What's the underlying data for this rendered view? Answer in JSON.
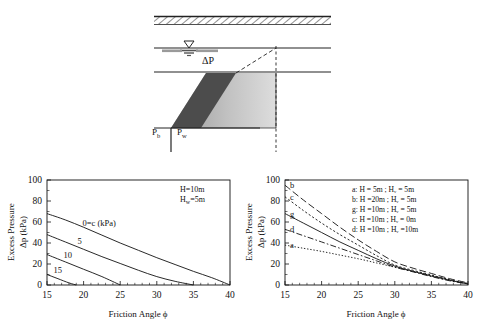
{
  "diagram": {
    "name": "excess-pressure-schematic",
    "labels": {
      "delta_p": "ΔP",
      "p_b": "P",
      "p_b_sub": "b",
      "p_w": "P",
      "p_w_sub": "w"
    },
    "colors": {
      "dark_wedge": "#4c4c4c",
      "light_wedge": "#b8b8b8",
      "line": "#222222"
    }
  },
  "chart_data": [
    {
      "id": "left",
      "type": "line",
      "title": "",
      "xlabel": "Friction Angle ϕ",
      "ylabel_line1": "Excess Pressure",
      "ylabel_line2": "Δp (kPa)",
      "xlim": [
        15,
        40
      ],
      "ylim": [
        0,
        100
      ],
      "xticks": [
        15,
        20,
        25,
        30,
        35,
        40
      ],
      "yticks": [
        0,
        20,
        40,
        60,
        80,
        100
      ],
      "grid": false,
      "annotations": [
        "H=10m",
        "Hᵥ=5m"
      ],
      "annotation_display": [
        "H=10m",
        "Hw=5m"
      ],
      "legend_position": "inline-curve-labels",
      "series": [
        {
          "name": "0=c  (kPa)",
          "label": "0=c  (kPa)",
          "x": [
            15,
            17.5,
            20,
            22.5,
            25,
            27.5,
            30,
            32.5,
            35,
            37.5,
            40
          ],
          "y": [
            68,
            62,
            55,
            47.5,
            40,
            33,
            26,
            19.5,
            13,
            7,
            0
          ]
        },
        {
          "name": "5",
          "label": "5",
          "x": [
            15,
            17.5,
            20,
            22.5,
            25,
            27.5,
            30,
            32.5,
            35
          ],
          "y": [
            48,
            41,
            34,
            27,
            20.5,
            14,
            8,
            3.5,
            0
          ]
        },
        {
          "name": "10",
          "label": "10",
          "x": [
            15,
            17.5,
            20,
            22.5,
            25
          ],
          "y": [
            29,
            22,
            15,
            8,
            0
          ]
        },
        {
          "name": "15",
          "label": "15",
          "x": [
            15,
            16.5,
            18,
            19
          ],
          "y": [
            10,
            6,
            2,
            0
          ]
        }
      ]
    },
    {
      "id": "right",
      "type": "line",
      "title": "",
      "xlabel": "Friction Angle ϕ",
      "ylabel_line1": "Excess Pressure",
      "ylabel_line2": "Δp (kPa)",
      "xlim": [
        15,
        40
      ],
      "ylim": [
        0,
        100
      ],
      "xticks": [
        15,
        20,
        25,
        30,
        35,
        40
      ],
      "yticks": [
        0,
        20,
        40,
        60,
        80,
        100
      ],
      "grid": false,
      "legend_position": "upper-right",
      "legend": [
        "a:  H =  5m ;  Hᵥ =  5m",
        "b:  H =20m ;  Hᵥ =  5m",
        "g:  H =10m ;  Hᵥ =  5m",
        "c:  H =10m ;  Hᵥ =  0m",
        "d:  H =10m ;  Hᵥ =10m"
      ],
      "curve_labels": [
        "b",
        "c",
        "g",
        "d",
        "a"
      ],
      "series": [
        {
          "name": "b",
          "label": "b",
          "style": "dashed-long",
          "x": [
            15,
            17.5,
            20,
            22.5,
            25,
            27.5,
            30,
            32.5,
            35,
            37.5,
            40
          ],
          "y": [
            95,
            81,
            68,
            55,
            43,
            32,
            22,
            16,
            11,
            6,
            2
          ]
        },
        {
          "name": "c",
          "label": "c",
          "style": "dotted",
          "x": [
            15,
            17.5,
            20,
            22.5,
            25,
            27.5,
            30,
            32.5,
            35,
            37.5,
            40
          ],
          "y": [
            84,
            71,
            59,
            48,
            38,
            28,
            19,
            14,
            9.5,
            5,
            1.5
          ]
        },
        {
          "name": "g",
          "label": "g",
          "style": "solid",
          "x": [
            15,
            17.5,
            20,
            22.5,
            25,
            27.5,
            30,
            32.5,
            35,
            37.5,
            40
          ],
          "y": [
            68,
            59,
            50,
            41,
            33,
            25,
            18,
            13,
            8.5,
            4.5,
            1
          ]
        },
        {
          "name": "d",
          "label": "d",
          "style": "dashdot",
          "x": [
            15,
            17.5,
            20,
            22.5,
            25,
            27.5,
            30,
            32.5,
            35,
            37.5,
            40
          ],
          "y": [
            53,
            47,
            41,
            35,
            29,
            23,
            17,
            12.5,
            8,
            4,
            1
          ]
        },
        {
          "name": "a",
          "label": "a",
          "style": "dotted-fine",
          "x": [
            15,
            17.5,
            20,
            22.5,
            25,
            27.5,
            30,
            32.5,
            35,
            37.5,
            40
          ],
          "y": [
            38,
            35,
            32,
            28.5,
            25,
            21,
            17,
            13,
            9,
            5,
            1
          ]
        }
      ]
    }
  ]
}
